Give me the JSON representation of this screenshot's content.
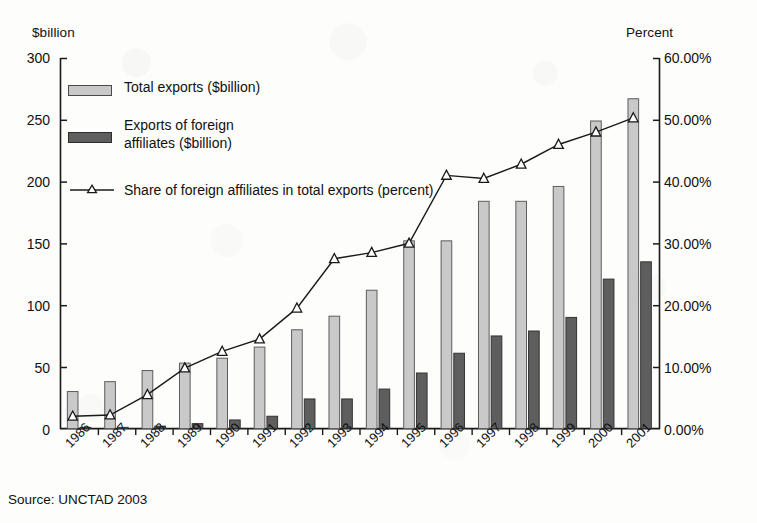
{
  "axes": {
    "left_title": "$billion",
    "right_title": "Percent",
    "left_ticks": [
      "300",
      "250",
      "200",
      "150",
      "100",
      "50",
      "0"
    ],
    "right_ticks": [
      "60.00%",
      "50.00%",
      "40.00%",
      "30.00%",
      "20.00%",
      "10.00%",
      "0.00%"
    ]
  },
  "legend": {
    "items": [
      {
        "label": "Total exports ($billion)",
        "type": "bar-light",
        "color": "#c9c9c9"
      },
      {
        "label": "Exports of foreign",
        "label2": "affiliates ($billion)",
        "type": "bar-dark",
        "color": "#5e5e5e"
      },
      {
        "label": "Share of foreign affiliates in total exports (percent)",
        "type": "line-marker",
        "color": "#1a1a1a"
      }
    ]
  },
  "source": "Source: UNCTAD 2003",
  "chart_data": {
    "type": "bar",
    "title": "",
    "subtitle": "",
    "xlabel": "",
    "ylabel": "$billion",
    "y2label": "Percent",
    "ylim": [
      0,
      300
    ],
    "y2lim": [
      0,
      60
    ],
    "grid": false,
    "legend_position": "upper-left-inside",
    "categories": [
      "1986",
      "1987",
      "1988",
      "1989",
      "1990",
      "1991",
      "1992",
      "1993",
      "1994",
      "1995",
      "1996",
      "1997",
      "1998",
      "1999",
      "2000",
      "2001"
    ],
    "series": [
      {
        "name": "Total exports ($billion)",
        "type": "bar",
        "axis": "left",
        "unit": "$billion",
        "color": "#c9c9c9",
        "values": [
          30,
          38,
          47,
          53,
          57,
          66,
          80,
          91,
          112,
          152,
          152,
          184,
          184,
          196,
          249,
          267
        ]
      },
      {
        "name": "Exports of foreign affiliates ($billion)",
        "type": "bar",
        "axis": "left",
        "unit": "$billion",
        "color": "#5e5e5e",
        "values": [
          1,
          1,
          2,
          4,
          7,
          10,
          24,
          24,
          32,
          45,
          61,
          75,
          79,
          90,
          121,
          135
        ]
      },
      {
        "name": "Share of foreign affiliates in total exports (percent)",
        "type": "line",
        "axis": "right",
        "unit": "percent",
        "color": "#1a1a1a",
        "marker": "triangle",
        "values": [
          2.0,
          2.2,
          5.5,
          9.8,
          12.5,
          14.5,
          19.5,
          27.5,
          28.5,
          30.0,
          41.0,
          40.5,
          42.8,
          46.0,
          48.0,
          50.3
        ]
      }
    ],
    "annotations": [
      {
        "text": "Source: UNCTAD 2003",
        "position": "below-axis-left"
      }
    ]
  }
}
